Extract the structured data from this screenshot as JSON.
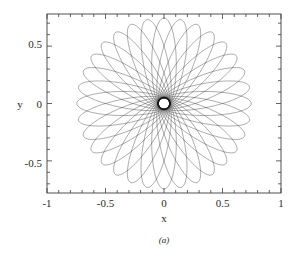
{
  "figure": {
    "caption": "(a)",
    "background_color": "#ffffff",
    "curve_color": "#1a1a1a",
    "axis_color": "#3c3c3c"
  },
  "chart_data": {
    "type": "line",
    "title": "",
    "subtitle": "",
    "xlabel": "x",
    "ylabel": "y",
    "xlim": [
      -1,
      1
    ],
    "ylim": [
      -0.78,
      0.78
    ],
    "grid": false,
    "legend": null,
    "x_ticks": [
      -1,
      -0.5,
      0,
      0.5,
      1
    ],
    "x_tick_labels": [
      "-1",
      "-0.5",
      "0",
      "0.5",
      "1"
    ],
    "y_ticks": [
      -0.5,
      0,
      0.5
    ],
    "y_tick_labels": [
      "-0.5",
      "0",
      "0.5"
    ],
    "x_minor_tick_count": 4,
    "y_minor_tick_count": 4,
    "series": [
      {
        "name": "precessing-orbit",
        "model": "rotating-ellipse-rosette",
        "semi_major_axis": 0.4,
        "semi_minor_axis": 0.105,
        "focus_offset": 0.345,
        "precession_step_deg": 11.25,
        "revolutions": 32,
        "outer_envelope_radius": 0.755,
        "inner_void_radius": 0.225,
        "x_extent": [
          -0.79,
          0.79
        ],
        "y_extent": [
          -0.55,
          0.55
        ]
      }
    ]
  }
}
